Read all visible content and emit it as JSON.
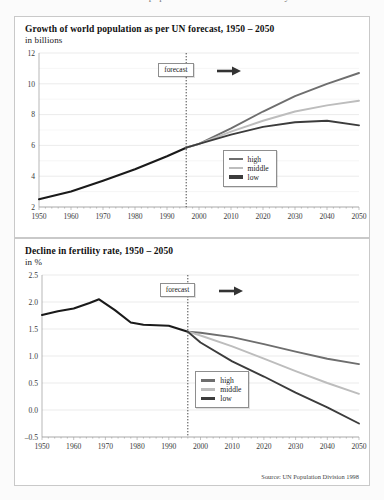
{
  "page": {
    "cut_off_header": "Growth of world population and decline in fertility rate"
  },
  "colors": {
    "high": "#6e6e6e",
    "middle": "#bdbdbd",
    "low": "#3c3c3c",
    "history": "#1a1a1a",
    "grid": "#dedede",
    "panel_border": "#c9c9c9"
  },
  "panel1": {
    "title": "Growth of  world population as per UN forecast, 1950 – 2050",
    "subtitle": "in billions",
    "forecast_label": "forecast",
    "legend": [
      {
        "key": "high",
        "label": "high"
      },
      {
        "key": "middle",
        "label": "middle"
      },
      {
        "key": "low",
        "label": "low"
      }
    ]
  },
  "panel2": {
    "title": "Decline in fertility rate, 1950 – 2050",
    "subtitle": "in %",
    "forecast_label": "forecast",
    "source": "Source: UN Population Division 1998",
    "legend": [
      {
        "key": "high",
        "label": "high"
      },
      {
        "key": "middle",
        "label": "middle"
      },
      {
        "key": "low",
        "label": "low"
      }
    ]
  },
  "chart_data": [
    {
      "id": "population",
      "type": "line",
      "title": "Growth of  world population as per UN forecast, 1950 – 2050",
      "subtitle": "in billions",
      "xlabel": "",
      "ylabel": "in billions",
      "xlim": [
        1950,
        2050
      ],
      "ylim": [
        2,
        12
      ],
      "yticks": [
        2,
        4,
        6,
        8,
        10,
        12
      ],
      "yticks_minor": [
        3,
        5,
        7,
        9,
        11
      ],
      "xticks": [
        1950,
        1960,
        1970,
        1980,
        1990,
        2000,
        2010,
        2020,
        2030,
        2040,
        2050
      ],
      "grid": true,
      "legend_position": "inside-right-lower",
      "forecast_year": 1996,
      "annotations": [
        {
          "text": "forecast",
          "x": 1996,
          "note": "arrow pointing right"
        }
      ],
      "series": [
        {
          "name": "history",
          "color": "#1a1a1a",
          "x": [
            1950,
            1960,
            1970,
            1980,
            1990,
            1996
          ],
          "values": [
            2.5,
            3.0,
            3.7,
            4.45,
            5.3,
            5.85
          ]
        },
        {
          "name": "high",
          "color": "#6e6e6e",
          "x": [
            1996,
            2000,
            2010,
            2020,
            2030,
            2040,
            2050
          ],
          "values": [
            5.85,
            6.1,
            7.1,
            8.2,
            9.2,
            10.0,
            10.7
          ]
        },
        {
          "name": "middle",
          "color": "#bdbdbd",
          "x": [
            1996,
            2000,
            2010,
            2020,
            2030,
            2040,
            2050
          ],
          "values": [
            5.85,
            6.1,
            6.9,
            7.6,
            8.2,
            8.6,
            8.9
          ]
        },
        {
          "name": "low",
          "color": "#3c3c3c",
          "x": [
            1996,
            2000,
            2010,
            2020,
            2030,
            2040,
            2050
          ],
          "values": [
            5.85,
            6.1,
            6.7,
            7.2,
            7.5,
            7.6,
            7.3
          ]
        }
      ]
    },
    {
      "id": "fertility",
      "type": "line",
      "title": "Decline in fertility rate, 1950 – 2050",
      "subtitle": "in %",
      "xlabel": "",
      "ylabel": "in %",
      "xlim": [
        1950,
        2050
      ],
      "ylim": [
        -0.5,
        2.5
      ],
      "yticks": [
        -0.5,
        0.0,
        0.5,
        1.0,
        1.5,
        2.0,
        2.5
      ],
      "xticks": [
        1950,
        1960,
        1970,
        1980,
        1990,
        2000,
        2010,
        2020,
        2030,
        2040,
        2050
      ],
      "grid": true,
      "legend_position": "inside-center-lower",
      "forecast_year": 1996,
      "annotations": [
        {
          "text": "forecast",
          "x": 1996,
          "note": "arrow pointing right"
        }
      ],
      "series": [
        {
          "name": "history",
          "color": "#1a1a1a",
          "x": [
            1950,
            1955,
            1960,
            1965,
            1968,
            1973,
            1978,
            1982,
            1990,
            1996
          ],
          "values": [
            1.76,
            1.83,
            1.88,
            1.98,
            2.05,
            1.85,
            1.62,
            1.58,
            1.56,
            1.45
          ]
        },
        {
          "name": "high",
          "color": "#6e6e6e",
          "x": [
            1996,
            2000,
            2010,
            2020,
            2030,
            2040,
            2050
          ],
          "values": [
            1.45,
            1.43,
            1.35,
            1.22,
            1.08,
            0.95,
            0.85
          ]
        },
        {
          "name": "middle",
          "color": "#bdbdbd",
          "x": [
            1996,
            2000,
            2010,
            2020,
            2030,
            2040,
            2050
          ],
          "values": [
            1.45,
            1.38,
            1.18,
            0.95,
            0.72,
            0.5,
            0.3
          ]
        },
        {
          "name": "low",
          "color": "#3c3c3c",
          "x": [
            1996,
            2000,
            2010,
            2020,
            2030,
            2040,
            2050
          ],
          "values": [
            1.45,
            1.25,
            0.9,
            0.62,
            0.32,
            0.05,
            -0.25
          ]
        }
      ]
    }
  ]
}
